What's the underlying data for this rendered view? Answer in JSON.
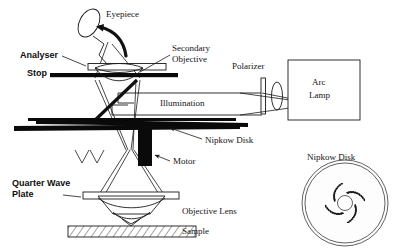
{
  "figure": {
    "background_color": "#ffffff",
    "ink_color": "#141414"
  },
  "labels": {
    "eyepiece": "Eyepiece",
    "analyser": "Analyser",
    "stop": "Stop",
    "secondary": "Secondary",
    "objective_secondary": "Objective",
    "polarizer": "Polarizer",
    "arc_lamp_line1": "Arc",
    "arc_lamp_line2": "Lamp",
    "illumination": "Illumination",
    "nipkow_disk_inline": "Nipkow Disk",
    "motor": "Motor",
    "quarter_wave_line1": "Quarter Wave",
    "quarter_wave_line2": "Plate",
    "objective_lens": "Objective Lens",
    "sample": "Sample",
    "nipkow_disk_panel": "Nipkow Disk"
  },
  "bold_labels": [
    "Analyser",
    "Stop",
    "Quarter Wave",
    "Plate"
  ],
  "components": [
    {
      "name": "eyepiece",
      "type": "tilted-ellipse",
      "label": "Eyepiece"
    },
    {
      "name": "analyser",
      "type": "open-rectangle",
      "label": "Analyser"
    },
    {
      "name": "stop",
      "type": "solid-bar",
      "label": "Stop"
    },
    {
      "name": "secondary-objective",
      "type": "lens",
      "label": "Secondary Objective"
    },
    {
      "name": "beamsplitter",
      "type": "tilted-bar",
      "label": ""
    },
    {
      "name": "polarizer",
      "type": "vertical-plate",
      "label": "Polarizer"
    },
    {
      "name": "condenser-lens",
      "type": "lens",
      "label": ""
    },
    {
      "name": "arc-lamp",
      "type": "open-box",
      "label": "Arc Lamp"
    },
    {
      "name": "nipkow-disk",
      "type": "thin-disk-edge",
      "label": "Nipkow Disk"
    },
    {
      "name": "motor",
      "type": "solid-block",
      "label": "Motor"
    },
    {
      "name": "quarter-wave-plate",
      "type": "open-rectangle",
      "label": "Quarter Wave Plate"
    },
    {
      "name": "objective-lens",
      "type": "cone-lens",
      "label": "Objective Lens"
    },
    {
      "name": "sample",
      "type": "hatched-slab",
      "label": "Sample"
    }
  ],
  "nipkow_panel": {
    "title": "Nipkow Disk",
    "outer_radius": 45,
    "hub_radius": 6,
    "spiral_arms": 4,
    "pinholes_per_arm": 11
  },
  "colors": {
    "ink": "#141414",
    "paper": "#ffffff",
    "solid": "#0a0a0a",
    "disk_stroke": "#3a3a3a"
  }
}
